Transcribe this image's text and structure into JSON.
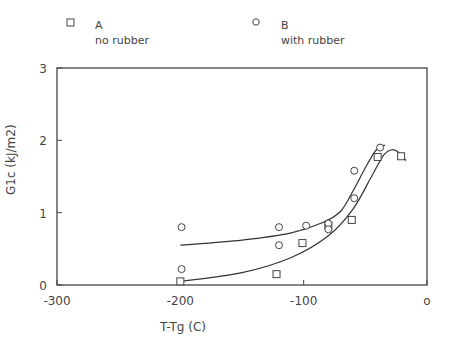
{
  "chart_data": {
    "type": "scatter",
    "title": "",
    "xlabel": "T-Tg (C)",
    "ylabel": "G1c (kJ/m2)",
    "xlim": [
      -300,
      0
    ],
    "ylim": [
      0,
      3
    ],
    "xticks": [
      "-300",
      "-200",
      "-100",
      "0"
    ],
    "yticks": [
      "0",
      "1",
      "2",
      "3"
    ],
    "grid": false,
    "legend_position": "top",
    "series": [
      {
        "name": "A",
        "description": "no rubber",
        "marker": "square",
        "points": [
          [
            -200,
            0.05
          ],
          [
            -122,
            0.15
          ],
          [
            -101,
            0.58
          ],
          [
            -80,
            0.82
          ],
          [
            -61,
            0.9
          ],
          [
            -40,
            1.77
          ],
          [
            -21,
            1.78
          ]
        ]
      },
      {
        "name": "B",
        "description": "with rubber",
        "marker": "circle",
        "points": [
          [
            -199,
            0.8
          ],
          [
            -199,
            0.22
          ],
          [
            -120,
            0.8
          ],
          [
            -120,
            0.55
          ],
          [
            -98,
            0.82
          ],
          [
            -80,
            0.85
          ],
          [
            -80,
            0.77
          ],
          [
            -59,
            1.2
          ],
          [
            -59,
            1.58
          ],
          [
            -38,
            1.9
          ]
        ]
      }
    ],
    "fit_curves": [
      {
        "name": "A fit",
        "points": [
          [
            -200,
            0.05
          ],
          [
            -150,
            0.17
          ],
          [
            -110,
            0.38
          ],
          [
            -80,
            0.68
          ],
          [
            -60,
            1.05
          ],
          [
            -45,
            1.5
          ],
          [
            -35,
            1.8
          ],
          [
            -28,
            1.87
          ],
          [
            -22,
            1.82
          ],
          [
            -17,
            1.72
          ]
        ]
      },
      {
        "name": "B fit",
        "points": [
          [
            -200,
            0.55
          ],
          [
            -150,
            0.62
          ],
          [
            -110,
            0.72
          ],
          [
            -85,
            0.86
          ],
          [
            -70,
            1.02
          ],
          [
            -60,
            1.3
          ],
          [
            -50,
            1.62
          ],
          [
            -42,
            1.85
          ],
          [
            -37,
            1.92
          ],
          [
            -34,
            1.93
          ]
        ]
      }
    ]
  },
  "legend": {
    "a": {
      "label": "A",
      "desc": "no rubber"
    },
    "b": {
      "label": "B",
      "desc": "with rubber"
    }
  }
}
